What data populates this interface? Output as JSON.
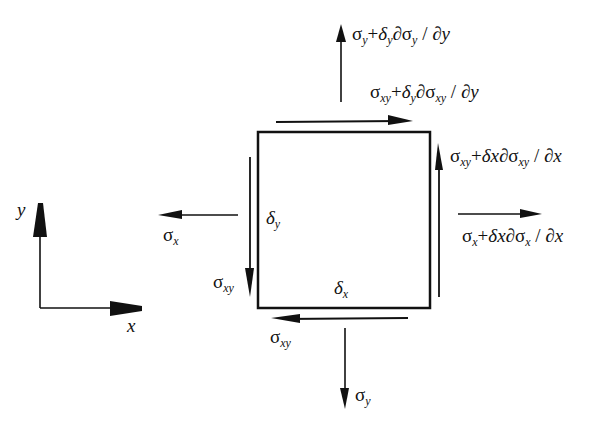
{
  "diagram": {
    "title": "",
    "type": "stress element free-body diagram",
    "colors": {
      "ink": "#111111",
      "background": "#ffffff"
    },
    "element": {
      "shape": "square",
      "width_label": "δx",
      "height_label": "δy"
    },
    "axes": {
      "x_label": "x",
      "y_label": "y"
    },
    "labels": {
      "top_normal": {
        "base": "σ",
        "sub": "y",
        "tail": "+δ",
        "tail_sub": "y",
        "tail2": "∂σ",
        "tail2_sub": "y",
        "tail3": " / ∂y",
        "full": "σy+δy∂σy/∂y"
      },
      "top_shear": {
        "full": "σxy+δy∂σxy/∂y"
      },
      "right_shear": {
        "full": "σxy+δx∂σxy/∂x"
      },
      "right_normal": {
        "full": "σx+δx∂σx/∂x"
      },
      "left_normal": {
        "full": "σx"
      },
      "left_shear": {
        "full": "σxy"
      },
      "bottom_shear": {
        "full": "σxy"
      },
      "bottom_normal": {
        "full": "σy"
      },
      "inner_left": {
        "full": "δy"
      },
      "inner_bottom": {
        "full": "δx"
      }
    },
    "text": {
      "sigma": "σ",
      "delta": "δ",
      "partial": "∂",
      "plus": "+",
      "slash": " / ",
      "x": "x",
      "y": "y",
      "xy": "xy",
      "dy": "∂y",
      "dx": "∂x"
    }
  }
}
